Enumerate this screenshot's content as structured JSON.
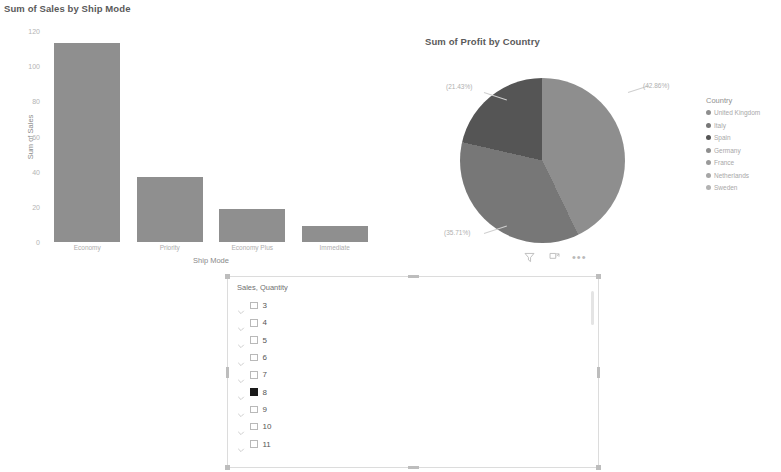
{
  "chart_data": [
    {
      "type": "bar",
      "title": "Sum of Sales by Ship Mode",
      "xlabel": "Ship Mode",
      "ylabel": "Sum of Sales",
      "categories": [
        "Economy",
        "Priority",
        "Economy Plus",
        "Immediate"
      ],
      "values": [
        113,
        37,
        19,
        9
      ],
      "ylim": [
        0,
        120
      ],
      "yticks": [
        "120",
        "100",
        "80",
        "60",
        "40",
        "20",
        "0"
      ],
      "ytick_values": [
        120,
        100,
        80,
        60,
        40,
        20,
        0
      ],
      "grid": false,
      "bar_color": "#8f8f8f"
    },
    {
      "type": "pie",
      "title": "Sum of Profit by Country",
      "legend_title": "Country",
      "legend_position": "right",
      "labels": [
        "United Kingdom",
        "Italy",
        "Spain",
        "Germany",
        "France",
        "Netherlands",
        "Sweden"
      ],
      "slices": [
        {
          "label": "United Kingdom",
          "percent": 42.86,
          "data_label": "(42.86%)",
          "color": "#8e8e8e"
        },
        {
          "label": "Italy",
          "percent": 35.71,
          "data_label": "(35.71%)",
          "color": "#777777"
        },
        {
          "label": "Spain",
          "percent": 21.43,
          "data_label": "(21.43%)",
          "color": "#555555"
        },
        {
          "label": "Germany",
          "percent": 0,
          "data_label": "",
          "color": "#8e8e8e"
        },
        {
          "label": "France",
          "percent": 0,
          "data_label": "",
          "color": "#9a9a9a"
        },
        {
          "label": "Netherlands",
          "percent": 0,
          "data_label": "",
          "color": "#a6a6a6"
        },
        {
          "label": "Sweden",
          "percent": 0,
          "data_label": "",
          "color": "#b2b2b2"
        }
      ],
      "values": [
        42.86,
        35.71,
        21.43,
        0,
        0,
        0,
        0
      ]
    }
  ],
  "bar_visual": {
    "title": "Sum of Sales by Ship Mode",
    "x_axis_title": "Ship Mode",
    "y_axis_title": "Sum of Sales",
    "y_ticks": [
      "120",
      "100",
      "80",
      "60",
      "40",
      "20",
      "0"
    ],
    "categories": [
      "Economy",
      "Priority",
      "Economy Plus",
      "Immediate"
    ]
  },
  "pie_visual": {
    "title": "Sum of Profit by Country",
    "labels": {
      "united_kingdom": "(42.86%)",
      "italy": "(21.43%)",
      "spain": "(35.71%)"
    },
    "toolbar": {
      "filter": "Filters",
      "focus": "Focus mode",
      "more": "More options",
      "more_glyph": "•••"
    }
  },
  "pie_legend": {
    "title": "Country",
    "items": [
      {
        "label": "United Kingdom",
        "color": "#8e8e8e"
      },
      {
        "label": "Italy",
        "color": "#777777"
      },
      {
        "label": "Spain",
        "color": "#555555"
      },
      {
        "label": "Germany",
        "color": "#8e8e8e"
      },
      {
        "label": "France",
        "color": "#9a9a9a"
      },
      {
        "label": "Netherlands",
        "color": "#a6a6a6"
      },
      {
        "label": "Sweden",
        "color": "#b2b2b2"
      }
    ]
  },
  "slicer": {
    "header": "Sales, Quantity",
    "items": [
      {
        "label": "3",
        "checked": false
      },
      {
        "label": "4",
        "checked": false
      },
      {
        "label": "5",
        "checked": false
      },
      {
        "label": "6",
        "checked": false
      },
      {
        "label": "7",
        "checked": false
      },
      {
        "label": "8",
        "checked": true
      },
      {
        "label": "9",
        "checked": false
      },
      {
        "label": "10",
        "checked": false
      },
      {
        "label": "11",
        "checked": false
      }
    ]
  }
}
